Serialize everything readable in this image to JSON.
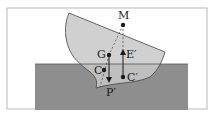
{
  "diagram": {
    "type": "physics-floating-body",
    "colors": {
      "frame": "#b8b8b8",
      "water": "#8e8e8e",
      "body": "#c8c8c8",
      "body_outline": "#444444",
      "ink": "#1a1a1a"
    },
    "labels": {
      "metacenter": "M",
      "center_of_gravity": "G",
      "center_of_buoyancy_old": "C",
      "center_of_buoyancy_new": "C′",
      "buoyant_force": "E′",
      "weight": "P′"
    }
  }
}
